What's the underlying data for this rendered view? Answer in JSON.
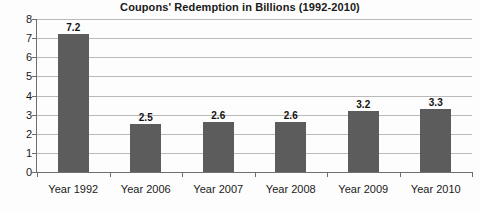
{
  "chart_data": {
    "type": "bar",
    "title": "Coupons' Redemption in Billions (1992-2010)",
    "subtitle": "",
    "xlabel": "",
    "ylabel": "",
    "categories": [
      "Year 1992",
      "Year 2006",
      "Year 2007",
      "Year 2008",
      "Year 2009",
      "Year 2010"
    ],
    "values": [
      7.2,
      2.5,
      2.6,
      2.6,
      3.2,
      3.3
    ],
    "value_labels": [
      "7.2",
      "2.5",
      "2.6",
      "2.6",
      "3.2",
      "3.3"
    ],
    "ylim": [
      0,
      8
    ],
    "ytick_labels": [
      "0",
      "1",
      "2",
      "3",
      "4",
      "5",
      "6",
      "7",
      "8"
    ],
    "ytick_values": [
      0,
      1,
      2,
      3,
      4,
      5,
      6,
      7,
      8
    ],
    "grid": true,
    "legend": false,
    "legend_position": "none",
    "bar_color": "#5c5c5c",
    "gridline_color": "#b9b9b9",
    "axis_color": "#6e6e6e",
    "background_color": "#fdfdfd",
    "text_color": "#1a1a1a"
  }
}
